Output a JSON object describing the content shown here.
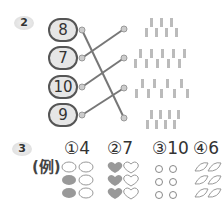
{
  "section2": {
    "badge": "2",
    "numbers": [
      "8",
      "7",
      "10",
      "9"
    ],
    "pencil_counts": [
      7,
      10,
      9,
      8
    ],
    "matches": [
      [
        0,
        3
      ],
      [
        1,
        0
      ],
      [
        2,
        1
      ],
      [
        3,
        2
      ]
    ]
  },
  "section3": {
    "badge": "3",
    "example_label": "(例)",
    "answers": [
      {
        "label": "①4",
        "icon": "flower"
      },
      {
        "label": "②7",
        "icon": "heart"
      },
      {
        "label": "③10",
        "icon": "ring"
      },
      {
        "label": "④6",
        "icon": "leaf"
      }
    ]
  },
  "colors": {
    "line": "#777777",
    "fill": "#9a9a9a",
    "outline": "#888888"
  }
}
